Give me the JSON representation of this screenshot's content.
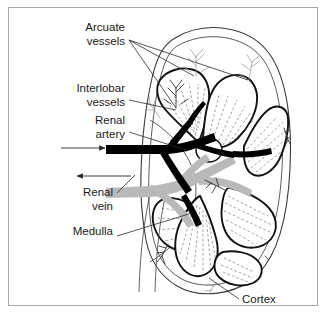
{
  "figure": {
    "background_color": "#ffffff",
    "frame_color": "#a8a8a8"
  },
  "colors": {
    "artery": "#000000",
    "vein": "#b9b9b9",
    "pyramid_outline": "#111111",
    "cortex_outline": "#4a4a4a",
    "arcuate_vessel": "#9a9a9a",
    "text": "#1a1a1a",
    "leader_line": "#2b2b2b"
  },
  "labels": [
    {
      "id": "arcuate-vessels",
      "line1": "Arcuate",
      "line2": "vessels",
      "align": "right",
      "x": 125,
      "y1": 31,
      "y2": 45,
      "leader_count": 3
    },
    {
      "id": "interlobar-vessels",
      "line1": "Interlobar",
      "line2": "vessels",
      "align": "right",
      "x": 125,
      "y1": 92,
      "y2": 106,
      "leader_count": 1
    },
    {
      "id": "renal-artery",
      "line1": "Renal",
      "line2": "artery",
      "align": "right",
      "x": 125,
      "y1": 124,
      "y2": 138,
      "leader_count": 1
    },
    {
      "id": "renal-vein",
      "line1": "Renal",
      "line2": "vein",
      "align": "right",
      "x": 113,
      "y1": 196,
      "y2": 210,
      "leader_count": 1
    },
    {
      "id": "medulla",
      "line1": "Medulla",
      "line2": "",
      "align": "right",
      "x": 113,
      "y1": 235,
      "y2": 0,
      "leader_count": 1
    },
    {
      "id": "cortex",
      "line1": "Cortex",
      "line2": "",
      "align": "left",
      "x": 242,
      "y1": 303,
      "y2": 0,
      "leader_count": 1
    }
  ],
  "flow_arrows": [
    {
      "id": "artery-inflow-arrow",
      "direction": "right",
      "x_start": 61,
      "x_end": 106,
      "y": 148
    },
    {
      "id": "vein-outflow-arrow",
      "direction": "left",
      "x_start": 131,
      "x_end": 76,
      "y": 176
    }
  ],
  "structures": [
    {
      "id": "renal-capsule",
      "name": "Renal capsule outline"
    },
    {
      "id": "renal-cortex",
      "name": "Cortex"
    },
    {
      "id": "renal-medulla",
      "name": "Medullary pyramids"
    },
    {
      "id": "renal-artery",
      "name": "Renal artery"
    },
    {
      "id": "renal-vein",
      "name": "Renal vein"
    },
    {
      "id": "interlobar-vessels",
      "name": "Interlobar vessels"
    },
    {
      "id": "arcuate-vessels",
      "name": "Arcuate vessels"
    },
    {
      "id": "renal-pelvis",
      "name": "Renal pelvis"
    },
    {
      "id": "ureter",
      "name": "Ureter"
    }
  ]
}
